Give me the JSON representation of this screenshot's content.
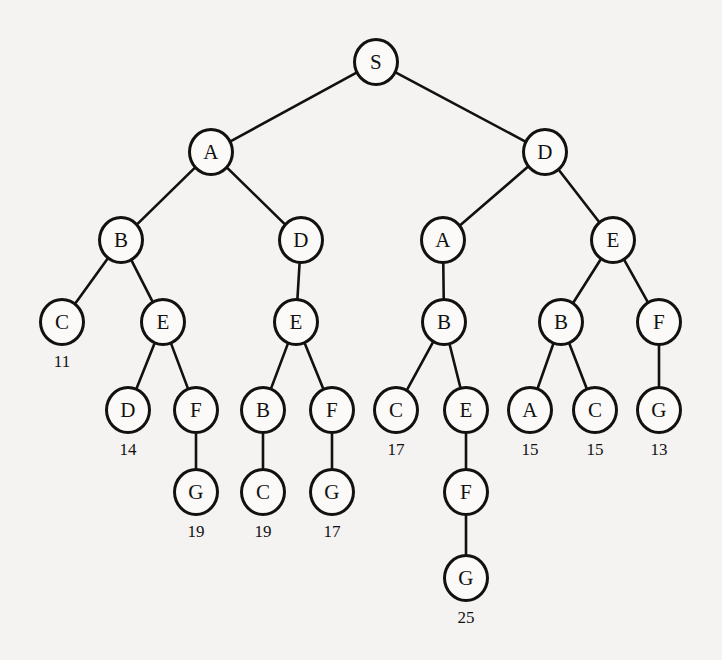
{
  "diagram": {
    "type": "search-tree",
    "title": "",
    "background_color": "#f4f3f1",
    "node_stroke_color": "#111111",
    "node_fill_color": "#fbfaf8",
    "edge_color": "#111111",
    "node_radius_x": 23,
    "node_radius_y": 24,
    "levels": 7,
    "nodes": [
      {
        "id": "n0",
        "label": "S",
        "x": 376,
        "y": 62,
        "cost": null,
        "level": 0
      },
      {
        "id": "n1",
        "label": "A",
        "x": 211,
        "y": 152,
        "cost": null,
        "level": 1
      },
      {
        "id": "n2",
        "label": "D",
        "x": 545,
        "y": 152,
        "cost": null,
        "level": 1
      },
      {
        "id": "n3",
        "label": "B",
        "x": 121,
        "y": 240,
        "cost": null,
        "level": 2
      },
      {
        "id": "n4",
        "label": "D",
        "x": 301,
        "y": 240,
        "cost": null,
        "level": 2
      },
      {
        "id": "n5",
        "label": "A",
        "x": 443,
        "y": 240,
        "cost": null,
        "level": 2
      },
      {
        "id": "n6",
        "label": "E",
        "x": 613,
        "y": 240,
        "cost": null,
        "level": 2
      },
      {
        "id": "n7",
        "label": "C",
        "x": 62,
        "y": 322,
        "cost": "11",
        "level": 3
      },
      {
        "id": "n8",
        "label": "E",
        "x": 163,
        "y": 322,
        "cost": null,
        "level": 3
      },
      {
        "id": "n9",
        "label": "E",
        "x": 296,
        "y": 322,
        "cost": null,
        "level": 3
      },
      {
        "id": "n10",
        "label": "B",
        "x": 444,
        "y": 322,
        "cost": null,
        "level": 3
      },
      {
        "id": "n11",
        "label": "B",
        "x": 561,
        "y": 322,
        "cost": null,
        "level": 3
      },
      {
        "id": "n12",
        "label": "F",
        "x": 659,
        "y": 322,
        "cost": null,
        "level": 3
      },
      {
        "id": "n13",
        "label": "D",
        "x": 128,
        "y": 410,
        "cost": "14",
        "level": 4
      },
      {
        "id": "n14",
        "label": "F",
        "x": 196,
        "y": 410,
        "cost": null,
        "level": 4
      },
      {
        "id": "n15",
        "label": "B",
        "x": 263,
        "y": 410,
        "cost": null,
        "level": 4
      },
      {
        "id": "n16",
        "label": "F",
        "x": 332,
        "y": 410,
        "cost": null,
        "level": 4
      },
      {
        "id": "n17",
        "label": "C",
        "x": 396,
        "y": 410,
        "cost": "17",
        "level": 4
      },
      {
        "id": "n18",
        "label": "E",
        "x": 466,
        "y": 410,
        "cost": null,
        "level": 4
      },
      {
        "id": "n19",
        "label": "A",
        "x": 530,
        "y": 410,
        "cost": "15",
        "level": 4
      },
      {
        "id": "n20",
        "label": "C",
        "x": 595,
        "y": 410,
        "cost": "15",
        "level": 4
      },
      {
        "id": "n21",
        "label": "G",
        "x": 659,
        "y": 410,
        "cost": "13",
        "level": 4
      },
      {
        "id": "n22",
        "label": "G",
        "x": 196,
        "y": 492,
        "cost": "19",
        "level": 5
      },
      {
        "id": "n23",
        "label": "C",
        "x": 263,
        "y": 492,
        "cost": "19",
        "level": 5
      },
      {
        "id": "n24",
        "label": "G",
        "x": 332,
        "y": 492,
        "cost": "17",
        "level": 5
      },
      {
        "id": "n25",
        "label": "F",
        "x": 466,
        "y": 492,
        "cost": null,
        "level": 5
      },
      {
        "id": "n26",
        "label": "G",
        "x": 466,
        "y": 578,
        "cost": "25",
        "level": 6
      }
    ],
    "edges": [
      {
        "from": "n0",
        "to": "n1"
      },
      {
        "from": "n0",
        "to": "n2"
      },
      {
        "from": "n1",
        "to": "n3"
      },
      {
        "from": "n1",
        "to": "n4"
      },
      {
        "from": "n2",
        "to": "n5"
      },
      {
        "from": "n2",
        "to": "n6"
      },
      {
        "from": "n3",
        "to": "n7"
      },
      {
        "from": "n3",
        "to": "n8"
      },
      {
        "from": "n4",
        "to": "n9"
      },
      {
        "from": "n5",
        "to": "n10"
      },
      {
        "from": "n6",
        "to": "n11"
      },
      {
        "from": "n6",
        "to": "n12"
      },
      {
        "from": "n8",
        "to": "n13"
      },
      {
        "from": "n8",
        "to": "n14"
      },
      {
        "from": "n9",
        "to": "n15"
      },
      {
        "from": "n9",
        "to": "n16"
      },
      {
        "from": "n10",
        "to": "n17"
      },
      {
        "from": "n10",
        "to": "n18"
      },
      {
        "from": "n11",
        "to": "n19"
      },
      {
        "from": "n11",
        "to": "n20"
      },
      {
        "from": "n12",
        "to": "n21"
      },
      {
        "from": "n14",
        "to": "n22"
      },
      {
        "from": "n15",
        "to": "n23"
      },
      {
        "from": "n16",
        "to": "n24"
      },
      {
        "from": "n18",
        "to": "n25"
      },
      {
        "from": "n25",
        "to": "n26"
      }
    ]
  }
}
